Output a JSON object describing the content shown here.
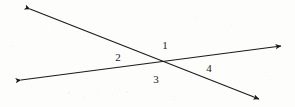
{
  "figure": {
    "kind": "geometry-diagram",
    "width": 295,
    "height": 107,
    "background_color": "#fdfdfc",
    "stroke_color": "#1a1a1a",
    "label_color": "#1a1a1a",
    "stroke_width": 1.1,
    "intersection": {
      "x": 163,
      "y": 61
    },
    "lines": [
      {
        "id": "line-descending",
        "name": "line-top-left-to-bottom-right",
        "from": {
          "x": 30,
          "y": 9
        },
        "to": {
          "x": 259,
          "y": 99
        },
        "arrow_start": true,
        "arrow_end": true
      },
      {
        "id": "line-ascending",
        "name": "line-bottom-left-to-right",
        "from": {
          "x": 21,
          "y": 80
        },
        "to": {
          "x": 281,
          "y": 46
        },
        "arrow_start": true,
        "arrow_end": true
      }
    ],
    "arrowheads": [
      {
        "id": "arrowhead-top-left",
        "x": 30,
        "y": 9
      },
      {
        "id": "arrowhead-bottom-right",
        "x": 259,
        "y": 99
      },
      {
        "id": "arrowhead-bottom-left",
        "x": 21,
        "y": 80
      },
      {
        "id": "arrowhead-right",
        "x": 281,
        "y": 46
      }
    ],
    "labels": [
      {
        "id": "angle-label-1",
        "text": "1",
        "x": 165,
        "y": 45,
        "position": "top"
      },
      {
        "id": "angle-label-2",
        "text": "2",
        "x": 118,
        "y": 57,
        "position": "left"
      },
      {
        "id": "angle-label-3",
        "text": "3",
        "x": 156,
        "y": 79,
        "position": "bottom"
      },
      {
        "id": "angle-label-4",
        "text": "4",
        "x": 209,
        "y": 68,
        "position": "right"
      }
    ]
  }
}
